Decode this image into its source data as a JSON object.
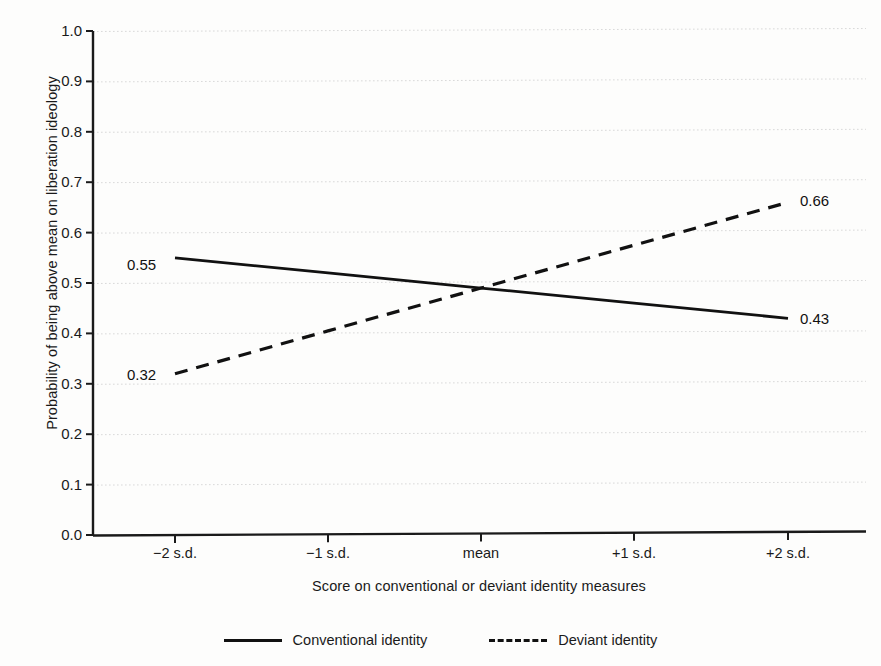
{
  "chart_data": {
    "type": "line",
    "title": "",
    "xlabel": "Score on conventional or deviant identity measures",
    "ylabel": "Probability of being above mean on liberation ideology",
    "categories": [
      "-2 s.d.",
      "-1 s.d.",
      "mean",
      "+1 s.d.",
      "+2 s.d."
    ],
    "xtick_labels": [
      "−2 s.d.",
      "−1 s.d.",
      "mean",
      "+1 s.d.",
      "+2 s.d."
    ],
    "ylim": [
      0.0,
      1.0
    ],
    "ytick_labels": [
      "1.0",
      "0.9",
      "0.8",
      "0.7",
      "0.6",
      "0.5",
      "0.4",
      "0.3",
      "0.2",
      "0.1",
      "0.0"
    ],
    "ytick_values": [
      1.0,
      0.9,
      0.8,
      0.7,
      0.6,
      0.5,
      0.4,
      0.3,
      0.2,
      0.1,
      0.0
    ],
    "grid": true,
    "grid_style": "dotted",
    "grid_color": "#d9d9d9",
    "legend_position": "below-axes",
    "series": [
      {
        "name": "Conventional identity",
        "style": "solid",
        "color": "#111111",
        "values": [
          0.55,
          0.52,
          0.49,
          0.46,
          0.43
        ],
        "endpoint_labels": {
          "start": "0.55",
          "end": "0.43"
        }
      },
      {
        "name": "Deviant identity",
        "style": "dashed",
        "color": "#111111",
        "values": [
          0.32,
          0.405,
          0.49,
          0.575,
          0.66
        ],
        "endpoint_labels": {
          "start": "0.32",
          "end": "0.66"
        }
      }
    ],
    "annotations": [
      {
        "text": "0.55",
        "series": "Conventional identity",
        "at": "-2 s.d.",
        "value": 0.55
      },
      {
        "text": "0.43",
        "series": "Conventional identity",
        "at": "+2 s.d.",
        "value": 0.43
      },
      {
        "text": "0.32",
        "series": "Deviant identity",
        "at": "-2 s.d.",
        "value": 0.32
      },
      {
        "text": "0.66",
        "series": "Deviant identity",
        "at": "+2 s.d.",
        "value": 0.66
      }
    ]
  },
  "legend": {
    "items": [
      {
        "label": "Conventional identity",
        "style": "solid"
      },
      {
        "label": "Deviant identity",
        "style": "dashed"
      }
    ]
  }
}
